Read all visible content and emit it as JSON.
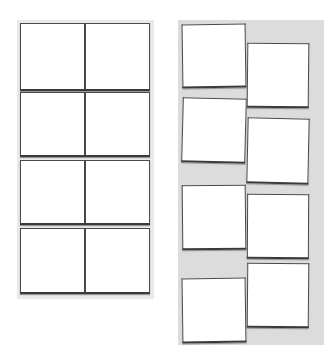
{
  "colors": {
    "page_background": "#ffffff",
    "left_panel_background": "#e9e9e9",
    "right_panel_background": "#dcdcdc",
    "frame_fill": "#ffffff",
    "frame_border": "#4a4a4a"
  },
  "layouts": [
    {
      "name": "grid-layout",
      "style": "aligned 2x4 grid",
      "frames": [
        {
          "x": 3,
          "y": 3,
          "w": 65,
          "h": 68,
          "rot": 0
        },
        {
          "x": 68,
          "y": 3,
          "w": 65,
          "h": 68,
          "rot": 0
        },
        {
          "x": 3,
          "y": 72,
          "w": 65,
          "h": 65,
          "rot": 0
        },
        {
          "x": 68,
          "y": 72,
          "w": 65,
          "h": 65,
          "rot": 0
        },
        {
          "x": 3,
          "y": 140,
          "w": 65,
          "h": 65,
          "rot": 0
        },
        {
          "x": 68,
          "y": 140,
          "w": 65,
          "h": 65,
          "rot": 0
        },
        {
          "x": 3,
          "y": 208,
          "w": 65,
          "h": 66,
          "rot": 0
        },
        {
          "x": 68,
          "y": 208,
          "w": 65,
          "h": 66,
          "rot": 0
        }
      ]
    },
    {
      "name": "staggered-layout",
      "style": "offset columns, slightly tilted frames",
      "frames": [
        {
          "x": 4,
          "y": 4,
          "w": 64,
          "h": 64,
          "rot": -0.8
        },
        {
          "x": 4,
          "y": 78,
          "w": 64,
          "h": 65,
          "rot": 1.5
        },
        {
          "x": 4,
          "y": 165,
          "w": 64,
          "h": 65,
          "rot": -0.6
        },
        {
          "x": 4,
          "y": 258,
          "w": 64,
          "h": 65,
          "rot": -0.8
        },
        {
          "x": 69,
          "y": 23,
          "w": 62,
          "h": 65,
          "rot": 0.6
        },
        {
          "x": 69,
          "y": 98,
          "w": 62,
          "h": 66,
          "rot": 1.2
        },
        {
          "x": 69,
          "y": 174,
          "w": 62,
          "h": 65,
          "rot": 0.3
        },
        {
          "x": 69,
          "y": 243,
          "w": 62,
          "h": 65,
          "rot": 0.5
        }
      ]
    }
  ]
}
